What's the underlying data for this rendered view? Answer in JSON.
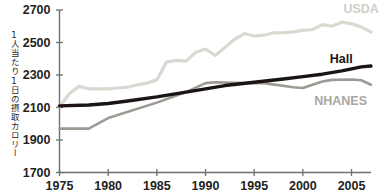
{
  "chart_data": {
    "type": "line",
    "title": "",
    "xlabel": "",
    "ylabel": "1人当たり1日の摂取カロリー",
    "xlim": [
      1975,
      2007
    ],
    "ylim": [
      1700,
      2700
    ],
    "ytick_values": [
      1700,
      1900,
      2100,
      2300,
      2500,
      2700
    ],
    "ytick_labels": [
      "1700",
      "1900",
      "2100",
      "2300",
      "2500",
      "2700"
    ],
    "xtick_values": [
      1975,
      1980,
      1985,
      1990,
      1995,
      2000,
      2005
    ],
    "xtick_labels": [
      "1975",
      "1980",
      "1985",
      "1990",
      "1995",
      "2000",
      "2005"
    ],
    "grid": false,
    "legend_position": "inline-right",
    "series": [
      {
        "name": "USDA",
        "color": "#d9d9d2",
        "label_color": "#cfcfc6",
        "label_x": 2005.2,
        "label_y": 2700,
        "x": [
          1975,
          1976,
          1977,
          1978,
          1979,
          1980,
          1981,
          1982,
          1983,
          1984,
          1985,
          1986,
          1987,
          1988,
          1989,
          1990,
          1991,
          1992,
          1993,
          1994,
          1995,
          1996,
          1997,
          1998,
          1999,
          2000,
          2001,
          2002,
          2003,
          2004,
          2005,
          2006,
          2007
        ],
        "values": [
          2105,
          2185,
          2230,
          2215,
          2215,
          2215,
          2220,
          2225,
          2240,
          2250,
          2270,
          2380,
          2390,
          2385,
          2440,
          2460,
          2420,
          2470,
          2520,
          2555,
          2540,
          2545,
          2560,
          2560,
          2565,
          2575,
          2580,
          2610,
          2600,
          2625,
          2615,
          2595,
          2565
        ]
      },
      {
        "name": "Hall",
        "color": "#1a1514",
        "label_color": "#1a1514",
        "label_x": 2003.8,
        "label_y": 2395,
        "x": [
          1975,
          1978,
          1980,
          1982,
          1985,
          1988,
          1990,
          1992,
          1995,
          1998,
          2000,
          2002,
          2004,
          2006,
          2007
        ],
        "values": [
          2110,
          2115,
          2125,
          2140,
          2165,
          2195,
          2215,
          2235,
          2255,
          2275,
          2290,
          2305,
          2325,
          2350,
          2355
        ]
      },
      {
        "name": "NHANES",
        "color": "#9b9b93",
        "label_color": "#a8a8a0",
        "label_x": 2002.2,
        "label_y": 2135,
        "x": [
          1975,
          1978,
          1980,
          1985,
          1988,
          1990,
          1991,
          1994,
          1996,
          1999,
          2000,
          2002,
          2003,
          2005,
          2006,
          2007
        ],
        "values": [
          1970,
          1970,
          2035,
          2130,
          2195,
          2250,
          2255,
          2250,
          2250,
          2225,
          2220,
          2260,
          2270,
          2272,
          2268,
          2240
        ]
      }
    ]
  },
  "axis": {
    "y_axis_name": "y-axis",
    "x_axis_name": "x-axis"
  }
}
